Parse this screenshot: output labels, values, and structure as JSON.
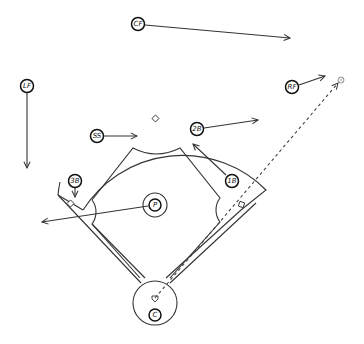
{
  "diagram": {
    "positions": [
      {
        "id": "cf",
        "label": "CF",
        "x": 138,
        "y": 24,
        "arrow_to": [
          290,
          38
        ]
      },
      {
        "id": "lf",
        "label": "LF",
        "x": 27,
        "y": 86,
        "arrow_to": [
          27,
          168
        ]
      },
      {
        "id": "rf",
        "label": "RF",
        "x": 292,
        "y": 87,
        "arrow_to": [
          325,
          76
        ]
      },
      {
        "id": "ss",
        "label": "SS",
        "x": 97,
        "y": 136,
        "arrow_to": [
          137,
          136
        ]
      },
      {
        "id": "2b",
        "label": "2B",
        "x": 197,
        "y": 129,
        "arrow_to": [
          258,
          120
        ]
      },
      {
        "id": "1b",
        "label": "1B",
        "x": 232,
        "y": 181,
        "arrow_to": [
          192,
          143
        ]
      },
      {
        "id": "3b",
        "label": "3B",
        "x": 75,
        "y": 181,
        "arrow_to": [
          75,
          197
        ]
      },
      {
        "id": "p",
        "label": "P",
        "x": 155,
        "y": 205,
        "arrow_to": [
          42,
          222
        ]
      },
      {
        "id": "c",
        "label": "C",
        "x": 155,
        "y": 315
      }
    ],
    "ball": {
      "x": 341,
      "y": 80,
      "label": "ball"
    },
    "hit_path": {
      "from": [
        155,
        298
      ],
      "to": [
        338,
        83
      ],
      "style": "dashed"
    },
    "colors": {
      "line": "#333333",
      "background": "#ffffff"
    }
  }
}
